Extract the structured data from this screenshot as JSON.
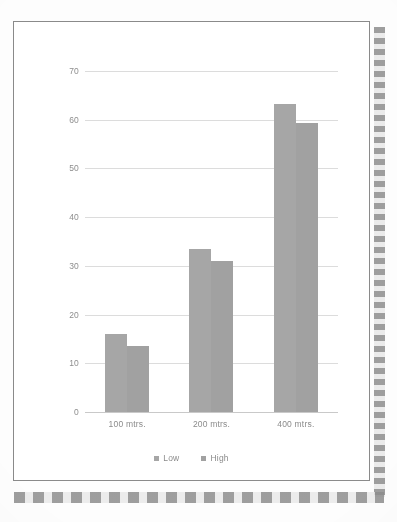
{
  "page": {
    "background_color": "#fdfdfd",
    "sheet_color": "#ffffff",
    "border_color": "#8a8a8a",
    "binding_color": "#8d8d8d"
  },
  "chart_data": {
    "type": "bar",
    "title": "",
    "subtitle": "",
    "xlabel": "",
    "ylabel": "",
    "categories": [
      "100 mtrs.",
      "200 mtrs.",
      "400 mtrs."
    ],
    "series": [
      {
        "name": "Low",
        "values": [
          16,
          33.5,
          63.3
        ],
        "color": "#a6a6a6"
      },
      {
        "name": "High",
        "values": [
          13.5,
          31,
          59.3
        ],
        "color": "#a1a1a1"
      }
    ],
    "ylim": [
      0,
      70
    ],
    "yticks": [
      0,
      10,
      20,
      30,
      40,
      50,
      60,
      70
    ],
    "ytick_labels": [
      "0",
      "10",
      "20",
      "30",
      "40",
      "50",
      "60",
      "70"
    ],
    "grid": true,
    "grid_color": "#dcdcdc",
    "legend": [
      "Low",
      "High"
    ],
    "legend_position": "bottom",
    "axis_label_color": "#8b8b8b"
  }
}
